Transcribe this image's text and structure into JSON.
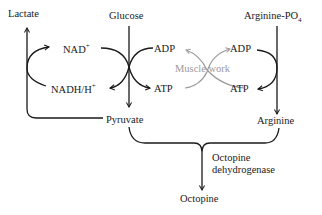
{
  "diagram": {
    "nodes": {
      "lactate": "Lactate",
      "glucose": "Glucose",
      "arginine_po4": "Arginine-PO",
      "arginine_po4_sub": "4",
      "nad": "NAD",
      "nad_sup": "+",
      "nadh": "NADH/H",
      "nadh_sup": "+",
      "adp_left": "ADP",
      "atp_left": "ATP",
      "adp_right": "ADP",
      "atp_right": "ATP",
      "muscle_work": "Muscle work",
      "pyruvate": "Pyruvate",
      "arginine": "Arginine",
      "enzyme_line1": "Octopine",
      "enzyme_line2": "dehydrogenase",
      "octopine": "Octopine"
    },
    "colors": {
      "main": "#1a1a1a",
      "muscle_work": "#9a9a9a"
    }
  }
}
